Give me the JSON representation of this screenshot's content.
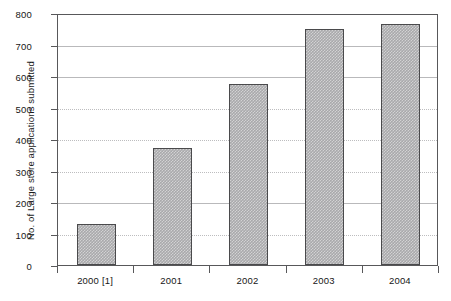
{
  "chart_data": {
    "type": "bar",
    "title": "",
    "subtitle": "",
    "xlabel": "",
    "ylabel": "No. of Large store applications submitted",
    "categories": [
      "2000 [1]",
      "2001",
      "2002",
      "2003",
      "2004"
    ],
    "values": [
      130,
      370,
      575,
      750,
      765
    ],
    "series": [
      {
        "name": "Large store applications submitted",
        "values": [
          130,
          370,
          575,
          750,
          765
        ]
      }
    ],
    "ylim": [
      0,
      800
    ],
    "yticks": [
      0,
      100,
      200,
      300,
      400,
      500,
      600,
      700,
      800
    ],
    "ytick_labels": [
      "0",
      "100",
      "200",
      "300",
      "400",
      "500",
      "600",
      "700",
      "800"
    ],
    "grid": "horizontal",
    "gridline_styles": [
      "solid",
      "dotted",
      "solid",
      "dotted",
      "dotted",
      "dotted",
      "solid",
      "solid",
      "solid"
    ],
    "legend": "none",
    "bar_color": "#a9a9ab",
    "bar_edge_color": "#4a4a4c",
    "axis_color": "#58585a",
    "grid_color": "#b9b9bb",
    "background_color": "#ffffff",
    "annotations": []
  }
}
